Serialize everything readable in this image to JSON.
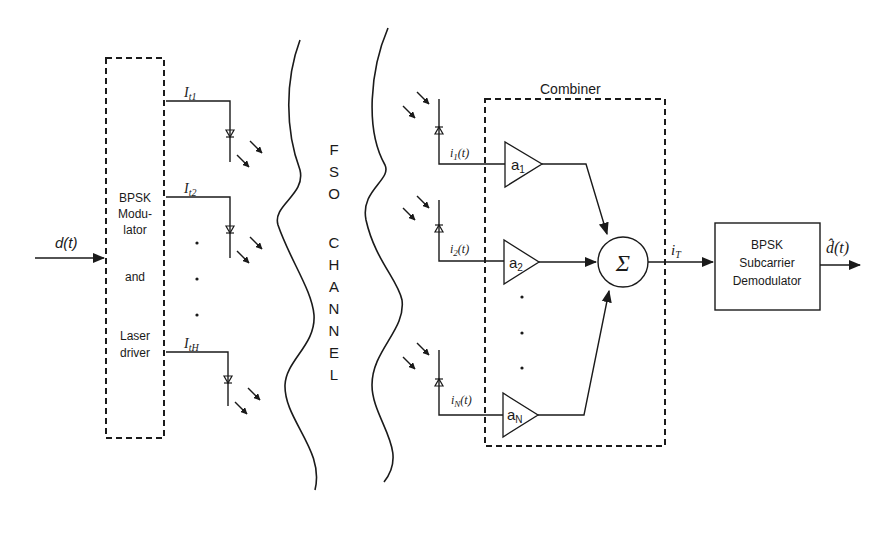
{
  "diagram": {
    "input_signal": "d(t)",
    "transmitter": {
      "block_lines": [
        "BPSK",
        "Modu-",
        "lator",
        "and",
        "Laser",
        "driver"
      ],
      "outputs": [
        {
          "label_main": "I",
          "label_sub": "t1"
        },
        {
          "label_main": "I",
          "label_sub": "t2"
        },
        {
          "label_main": "I",
          "label_sub": "tH"
        }
      ]
    },
    "channel": {
      "letters": [
        "F",
        "S",
        "O",
        "C",
        "H",
        "A",
        "N",
        "N",
        "E",
        "L"
      ]
    },
    "receivers": [
      {
        "current_main": "i",
        "current_sub": "1",
        "current_suffix": "(t)",
        "gain_main": "a",
        "gain_sub": "1"
      },
      {
        "current_main": "i",
        "current_sub": "2",
        "current_suffix": "(t)",
        "gain_main": "a",
        "gain_sub": "2"
      },
      {
        "current_main": "i",
        "current_sub": "N",
        "current_suffix": "(t)",
        "gain_main": "a",
        "gain_sub": "N"
      }
    ],
    "combiner": {
      "title": "Combiner",
      "summer_symbol": "Σ",
      "output_main": "i",
      "output_sub": "T"
    },
    "demodulator": {
      "lines": [
        "BPSK",
        "Subcarrier",
        "Demodulator"
      ]
    },
    "output_signal": "d̂(t)"
  }
}
